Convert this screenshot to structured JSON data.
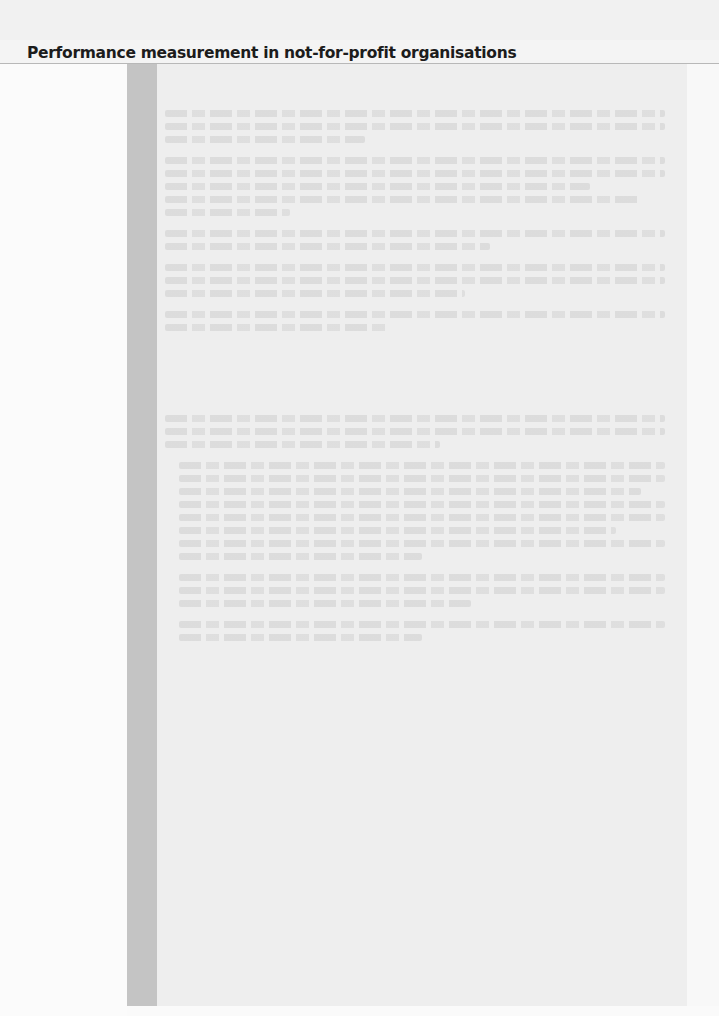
{
  "page": {
    "running_head": "Performance measurement in not-for-profit organisations"
  },
  "box": {
    "sections": [
      {
        "heading": "",
        "paragraphs": [
          {
            "lines": [
              1,
              1,
              0.4
            ],
            "indent": false
          },
          {
            "lines": [
              1,
              1,
              0.85,
              0.95,
              0.25
            ],
            "indent": false
          },
          {
            "lines": [
              1,
              0.65
            ],
            "indent": false
          },
          {
            "lines": [
              1,
              1,
              0.6
            ],
            "indent": false
          },
          {
            "lines": [
              1,
              0.45
            ],
            "indent": false
          }
        ]
      },
      {
        "heading": "",
        "paragraphs": [
          {
            "lines": [
              1,
              1,
              0.55
            ],
            "indent": false
          },
          {
            "lines": [
              1,
              1,
              0.95,
              1,
              1,
              0.9,
              1,
              0.5
            ],
            "indent": true
          },
          {
            "lines": [
              1,
              1,
              0.6
            ],
            "indent": true
          },
          {
            "lines": [
              1,
              0.5
            ],
            "indent": true
          }
        ]
      }
    ],
    "legibility_note": "Body text in the shaded box is faded bleed-through and not legible."
  }
}
